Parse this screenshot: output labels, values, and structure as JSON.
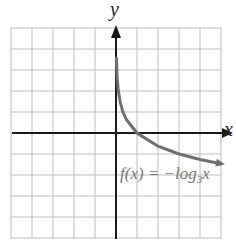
{
  "chart_data": {
    "type": "line",
    "title": "",
    "xlabel": "x",
    "ylabel": "y",
    "xlim": [
      -5,
      5
    ],
    "ylim": [
      -5,
      5
    ],
    "grid": true,
    "grid_step": 1,
    "series": [
      {
        "name": "f(x) = -log_3 x",
        "x": [
          0.02,
          0.05,
          0.1,
          0.2,
          0.33,
          0.5,
          1,
          2,
          3,
          4,
          5
        ],
        "values": [
          3.56,
          2.73,
          2.1,
          1.46,
          1.0,
          0.63,
          0,
          -0.63,
          -1,
          -1.26,
          -1.46
        ],
        "color": "#6e6e6e"
      }
    ],
    "annotations": [
      {
        "text": "f(x) = −log₃x",
        "x": 2.5,
        "y": -1.7
      }
    ]
  },
  "labels": {
    "x_axis": "x",
    "y_axis": "y",
    "function_prefix": "f(x) = −log",
    "function_base": "3",
    "function_var": "x"
  },
  "colors": {
    "grid": "#bdbdbd",
    "axes": "#1a1a1a",
    "curve": "#6e6e6e"
  }
}
